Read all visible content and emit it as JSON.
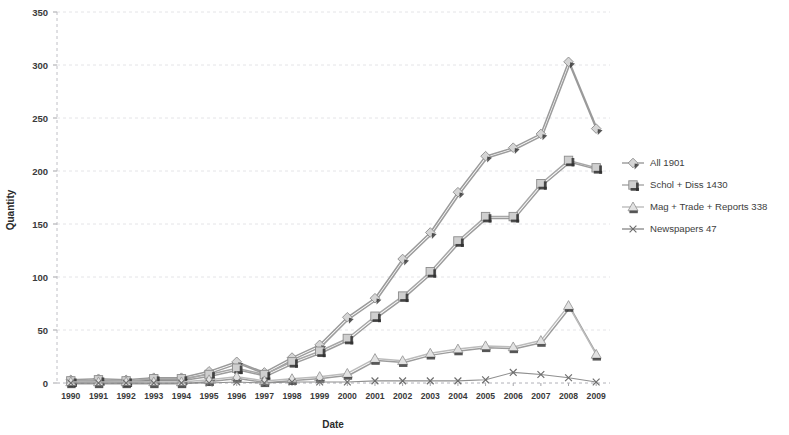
{
  "chart_data": {
    "type": "line",
    "title": "",
    "xlabel": "Date",
    "ylabel": "Quantity",
    "ylim": [
      0,
      350
    ],
    "ytick_step": 50,
    "yticks": [
      "0",
      "50",
      "100",
      "150",
      "200",
      "250",
      "300",
      "350"
    ],
    "grid": true,
    "legend_position": "right",
    "categories": [
      "1990",
      "1991",
      "1992",
      "1993",
      "1994",
      "1995",
      "1996",
      "1997",
      "1998",
      "1999",
      "2000",
      "2001",
      "2002",
      "2003",
      "2004",
      "2005",
      "2006",
      "2007",
      "2008",
      "2009"
    ],
    "series": [
      {
        "name": "All 1901",
        "legend_label": "All 1901",
        "marker": "diamond",
        "color": "#9a9a9a",
        "values": [
          3,
          4,
          3,
          5,
          5,
          11,
          20,
          10,
          24,
          36,
          62,
          80,
          117,
          142,
          180,
          214,
          222,
          235,
          303,
          240
        ]
      },
      {
        "name": "Schol + Diss 1430",
        "legend_label": "Schol + Diss 1430",
        "marker": "square",
        "color": "#a7a7a7",
        "values": [
          2,
          3,
          2,
          4,
          4,
          8,
          14,
          8,
          20,
          30,
          42,
          63,
          82,
          105,
          134,
          157,
          157,
          188,
          210,
          203
        ]
      },
      {
        "name": "Mag + Trade + Reports 338",
        "legend_label": "Mag + Trade + Reports 338",
        "marker": "triangle",
        "color": "#bcbcbc",
        "values": [
          1,
          1,
          1,
          1,
          1,
          3,
          6,
          2,
          4,
          6,
          9,
          23,
          21,
          28,
          32,
          35,
          34,
          40,
          73,
          27
        ]
      },
      {
        "name": "Newspapers 47",
        "legend_label": "Newspapers 47",
        "marker": "cross",
        "color": "#8f8f8f",
        "values": [
          0,
          0,
          0,
          0,
          0,
          0,
          1,
          0,
          1,
          1,
          1,
          2,
          2,
          2,
          2,
          3,
          10,
          8,
          5,
          1
        ]
      }
    ]
  },
  "axes": {
    "y_title": "Quantity",
    "x_title": "Date"
  },
  "legend": {
    "entries": [
      {
        "label": "All 1901",
        "marker": "diamond-marker-icon"
      },
      {
        "label": "Schol + Diss 1430",
        "marker": "square-marker-icon"
      },
      {
        "label": "Mag + Trade + Reports 338",
        "marker": "triangle-marker-icon"
      },
      {
        "label": "Newspapers 47",
        "marker": "cross-marker-icon"
      }
    ]
  },
  "colors": {
    "grid": "#d8d8dd",
    "axis": "#b9b9bf",
    "text": "#3a3a3a",
    "series_all": "#9a9a9a",
    "series_schol": "#a7a7a7",
    "series_mag": "#bcbcbc",
    "series_news": "#8f8f8f"
  }
}
